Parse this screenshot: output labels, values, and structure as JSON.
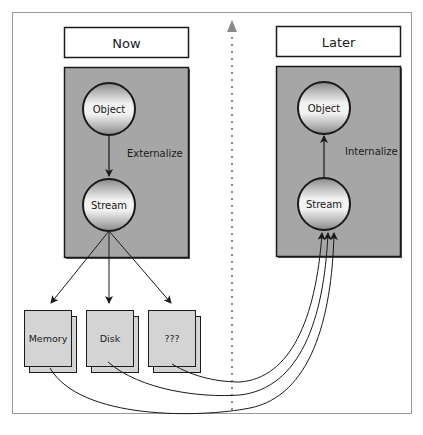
{
  "diagram": {
    "now_panel": {
      "title": "Now",
      "top_node": "Object",
      "bottom_node": "Stream",
      "arrow_label": "Externalize"
    },
    "later_panel": {
      "title": "Later",
      "top_node": "Object",
      "bottom_node": "Stream",
      "arrow_label": "Internalize"
    },
    "storage": [
      {
        "label": "Memory"
      },
      {
        "label": "Disk"
      },
      {
        "label": "???"
      }
    ],
    "colors": {
      "panel_fill": "#a6a6a6",
      "storage_fill": "#d4d4d4",
      "stroke": "#1a1a1a",
      "frame": "#9a9a9a",
      "divider": "#8a8a8a"
    }
  }
}
